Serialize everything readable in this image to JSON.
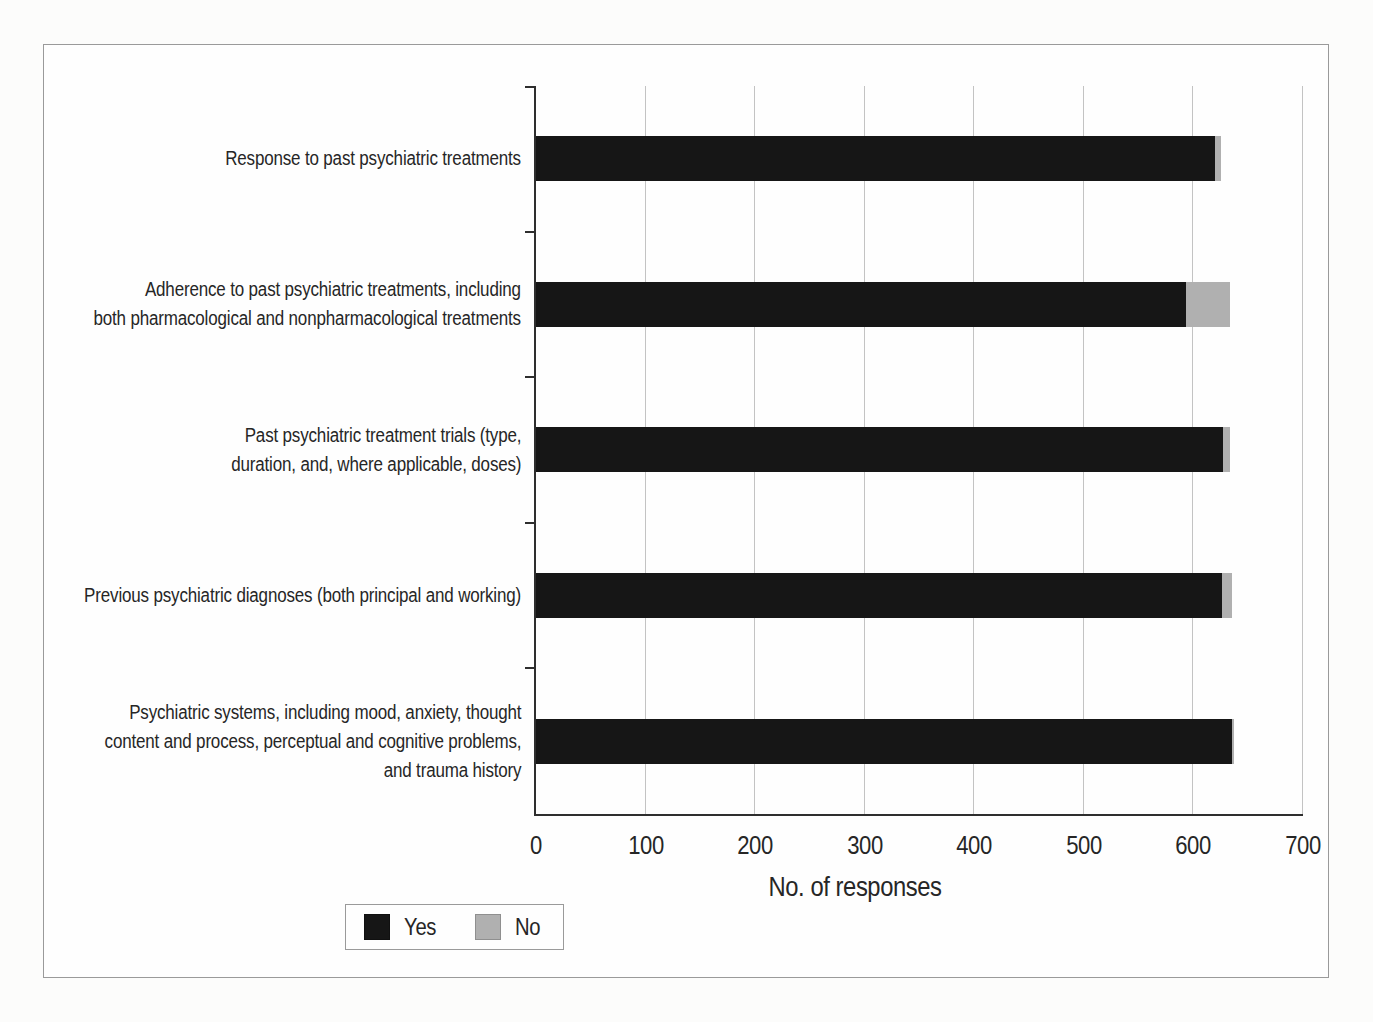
{
  "page": {
    "background": "#fcfcfb"
  },
  "figure": {
    "border_color": "#9a9a9a",
    "background": "#fefefe"
  },
  "colors": {
    "axis": "#2e2e2e",
    "gridline": "#c3c3c3",
    "text": "#262626",
    "border": "#9a9a9a",
    "yes": "#161616",
    "no": "#b0b0b0"
  },
  "chart_data": {
    "type": "bar",
    "orientation": "horizontal",
    "stacked": true,
    "title": "",
    "xlabel": "No. of responses",
    "ylabel": "",
    "xlim": [
      0,
      700
    ],
    "xticks": [
      0,
      100,
      200,
      300,
      400,
      500,
      600,
      700
    ],
    "grid": "vertical gridlines every 100",
    "legend_position": "bottom-left",
    "categories": [
      "Response to past psychiatric treatments",
      "Adherence to past psychiatric treatments, including\nboth pharmacological and nonpharmacological treatments",
      "Past psychiatric treatment trials (type,\nduration, and, where applicable, doses)",
      "Previous psychiatric diagnoses (both principal and working)",
      "Psychiatric systems, including mood, anxiety, thought\ncontent and process, perceptual and cognitive problems,\nand trauma history"
    ],
    "series": [
      {
        "name": "Yes",
        "color": "#161616",
        "values": [
          620,
          593,
          627,
          626,
          635
        ]
      },
      {
        "name": "No",
        "color": "#b0b0b0",
        "values": [
          5,
          40,
          6,
          9,
          2
        ]
      }
    ]
  }
}
